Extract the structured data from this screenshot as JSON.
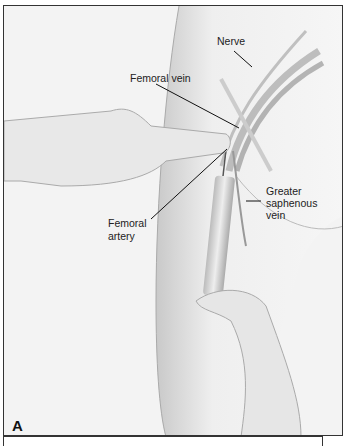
{
  "figure": {
    "panel_letter": "A",
    "labels": {
      "nerve": "Nerve",
      "femoral_vein": "Femoral vein",
      "femoral_artery_line1": "Femoral",
      "femoral_artery_line2": "artery",
      "saphenous_line1": "Greater",
      "saphenous_line2": "saphenous",
      "saphenous_line3": "vein"
    }
  }
}
